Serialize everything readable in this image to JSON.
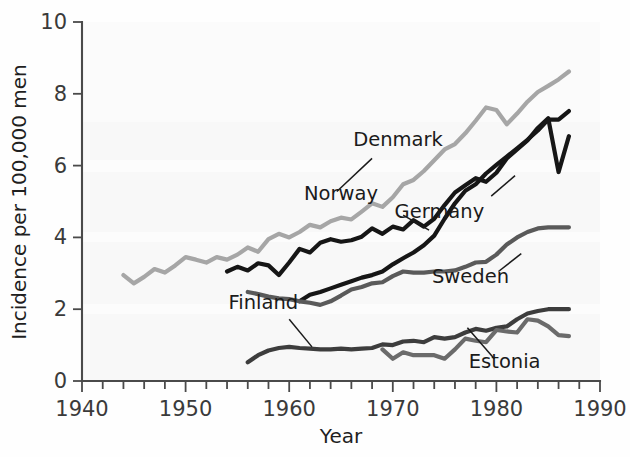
{
  "chart_data": {
    "type": "line",
    "title": "",
    "xlabel": "Year",
    "ylabel": "Incidence per 100,000 men",
    "xlim": [
      1940,
      1990
    ],
    "ylim": [
      0,
      10
    ],
    "xticks": [
      1940,
      1950,
      1960,
      1970,
      1980,
      1990
    ],
    "yticks": [
      0,
      2,
      4,
      6,
      8,
      10
    ],
    "xminor_step": 2,
    "grid": false,
    "legend": "inline-labels",
    "series": [
      {
        "name": "Denmark",
        "color": "#a6a6a6",
        "label_x": 1970.5,
        "label_y": 6.55,
        "leader": [
          [
            1968.0,
            6.2
          ],
          [
            1964.6,
            5.28
          ]
        ],
        "x": [
          1944,
          1945,
          1946,
          1947,
          1948,
          1949,
          1950,
          1951,
          1952,
          1953,
          1954,
          1955,
          1956,
          1957,
          1958,
          1959,
          1960,
          1961,
          1962,
          1963,
          1964,
          1965,
          1966,
          1967,
          1968,
          1969,
          1970,
          1971,
          1972,
          1973,
          1974,
          1975,
          1976,
          1977,
          1978,
          1979,
          1980,
          1981,
          1982,
          1983,
          1984,
          1985,
          1986,
          1987
        ],
        "y": [
          2.95,
          2.72,
          2.9,
          3.12,
          3.02,
          3.22,
          3.45,
          3.38,
          3.3,
          3.45,
          3.38,
          3.52,
          3.72,
          3.6,
          3.95,
          4.1,
          4.0,
          4.15,
          4.35,
          4.28,
          4.45,
          4.55,
          4.5,
          4.72,
          4.95,
          4.85,
          5.12,
          5.48,
          5.6,
          5.85,
          6.15,
          6.45,
          6.6,
          6.9,
          7.25,
          7.62,
          7.55,
          7.15,
          7.45,
          7.78,
          8.05,
          8.22,
          8.4,
          8.62
        ]
      },
      {
        "name": "Norway",
        "color": "#161616",
        "label_x": 1965.0,
        "label_y": 5.05,
        "leader": [
          [
            1971.0,
            4.62
          ],
          [
            1973.5,
            4.2
          ]
        ],
        "x": [
          1954,
          1955,
          1956,
          1957,
          1958,
          1959,
          1960,
          1961,
          1962,
          1963,
          1964,
          1965,
          1966,
          1967,
          1968,
          1969,
          1970,
          1971,
          1972,
          1973,
          1974,
          1975,
          1976,
          1977,
          1978,
          1979,
          1980,
          1981,
          1982,
          1983,
          1984,
          1985,
          1986,
          1987
        ],
        "y": [
          3.05,
          3.18,
          3.08,
          3.28,
          3.22,
          2.95,
          3.3,
          3.68,
          3.58,
          3.85,
          3.95,
          3.88,
          3.92,
          4.02,
          4.25,
          4.1,
          4.3,
          4.22,
          4.48,
          4.3,
          4.52,
          4.9,
          5.25,
          5.45,
          5.65,
          5.55,
          5.8,
          6.2,
          6.45,
          6.7,
          7.05,
          7.32,
          5.82,
          6.82
        ]
      },
      {
        "name": "Germany",
        "color": "#161616",
        "label_x": 1974.5,
        "label_y": 4.55,
        "leader": [
          [
            1979.5,
            5.15
          ],
          [
            1981.8,
            5.72
          ]
        ],
        "x": [
          1961,
          1962,
          1963,
          1964,
          1965,
          1966,
          1967,
          1968,
          1969,
          1970,
          1971,
          1972,
          1973,
          1974,
          1975,
          1976,
          1977,
          1978,
          1979,
          1980,
          1981,
          1982,
          1983,
          1984,
          1985,
          1986,
          1987
        ],
        "y": [
          2.22,
          2.4,
          2.48,
          2.58,
          2.68,
          2.78,
          2.88,
          2.95,
          3.05,
          3.25,
          3.42,
          3.58,
          3.78,
          4.05,
          4.52,
          4.95,
          5.3,
          5.48,
          5.78,
          6.02,
          6.25,
          6.48,
          6.72,
          6.98,
          7.28,
          7.28,
          7.52
        ]
      },
      {
        "name": "Sweden",
        "color": "#5a5a5a",
        "label_x": 1977.5,
        "label_y": 2.72,
        "leader": [
          [
            1980.2,
            3.05
          ],
          [
            1982.4,
            3.55
          ]
        ],
        "x": [
          1956,
          1957,
          1958,
          1959,
          1960,
          1961,
          1962,
          1963,
          1964,
          1965,
          1966,
          1967,
          1968,
          1969,
          1970,
          1971,
          1972,
          1973,
          1974,
          1975,
          1976,
          1977,
          1978,
          1979,
          1980,
          1981,
          1982,
          1983,
          1984,
          1985,
          1986,
          1987
        ],
        "y": [
          2.48,
          2.42,
          2.35,
          2.3,
          2.28,
          2.22,
          2.18,
          2.12,
          2.22,
          2.38,
          2.55,
          2.62,
          2.72,
          2.75,
          2.92,
          3.05,
          3.02,
          3.02,
          3.05,
          3.05,
          3.08,
          3.18,
          3.3,
          3.32,
          3.52,
          3.8,
          4.0,
          4.15,
          4.25,
          4.28,
          4.28,
          4.28
        ]
      },
      {
        "name": "Finland",
        "color": "#3d3d3d",
        "label_x": 1957.5,
        "label_y": 2.0,
        "leader": [
          [
            1960.0,
            1.72
          ],
          [
            1962.2,
            0.95
          ]
        ],
        "x": [
          1956,
          1957,
          1958,
          1959,
          1960,
          1961,
          1962,
          1963,
          1964,
          1965,
          1966,
          1967,
          1968,
          1969,
          1970,
          1971,
          1972,
          1973,
          1974,
          1975,
          1976,
          1977,
          1978,
          1979,
          1980,
          1981,
          1982,
          1983,
          1984,
          1985,
          1986,
          1987
        ],
        "y": [
          0.52,
          0.72,
          0.85,
          0.92,
          0.95,
          0.92,
          0.9,
          0.88,
          0.88,
          0.9,
          0.88,
          0.9,
          0.92,
          1.02,
          1.0,
          1.1,
          1.12,
          1.08,
          1.22,
          1.18,
          1.22,
          1.35,
          1.45,
          1.4,
          1.48,
          1.52,
          1.72,
          1.88,
          1.95,
          2.0,
          2.0,
          2.0
        ]
      },
      {
        "name": "Estonia",
        "color": "#6b6b6b",
        "label_x": 1980.8,
        "label_y": 0.35,
        "leader": [
          [
            1979.8,
            0.62
          ],
          [
            1977.2,
            1.48
          ]
        ],
        "x": [
          1969,
          1970,
          1971,
          1972,
          1973,
          1974,
          1975,
          1976,
          1977,
          1978,
          1979,
          1980,
          1981,
          1982,
          1983,
          1984,
          1985,
          1986,
          1987
        ],
        "y": [
          0.88,
          0.62,
          0.8,
          0.72,
          0.72,
          0.72,
          0.62,
          0.88,
          1.18,
          1.12,
          1.08,
          1.42,
          1.38,
          1.35,
          1.72,
          1.68,
          1.52,
          1.28,
          1.25
        ]
      }
    ]
  },
  "axes": {
    "x_tick_labels": [
      "1940",
      "1950",
      "1960",
      "1970",
      "1980",
      "1990"
    ],
    "y_tick_labels": [
      "0",
      "2",
      "4",
      "6",
      "8",
      "10"
    ],
    "x_axis_title": "Year",
    "y_axis_title": "Incidence per 100,000 men"
  },
  "series_labels": {
    "denmark": "Denmark",
    "norway": "Norway",
    "germany": "Germany",
    "sweden": "Sweden",
    "finland": "Finland",
    "estonia": "Estonia"
  }
}
